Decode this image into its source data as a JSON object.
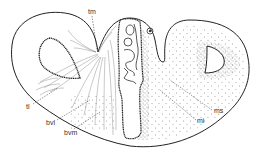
{
  "figure": {
    "type": "anatomical cross-section line drawing",
    "background": "#ffffff",
    "ink_color": "#222222",
    "labels": [
      {
        "id": "tm",
        "text": "tm",
        "x": 88,
        "y": 8
      },
      {
        "id": "tl",
        "text": "tl",
        "x": 27,
        "y": 104
      },
      {
        "id": "bvl",
        "text": "bvl",
        "x": 48,
        "y": 120
      },
      {
        "id": "bvm",
        "text": "bvm",
        "x": 66,
        "y": 129
      },
      {
        "id": "ms",
        "text": "ms",
        "x": 214,
        "y": 108
      },
      {
        "id": "mi",
        "text": "mi",
        "x": 197,
        "y": 118
      }
    ]
  }
}
